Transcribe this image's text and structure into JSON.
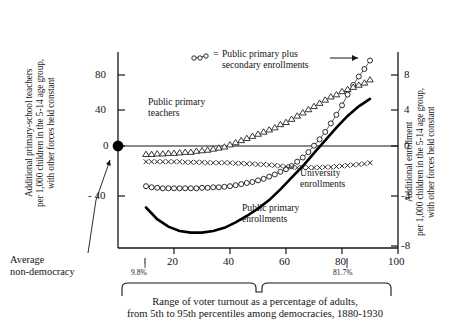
{
  "axis_labels": {
    "left": "Additional primary-school teachers\nper 1,000 children in the 5-14 age group,\nwith other forces held constant",
    "right": "Additional enrollment\nper 1,000 children in the 5-14 age group,\nwith other forces held constant",
    "bottom_caption": "Range of voter turnout as a percentage of adults,\nfrom 5th to 95th percentiles among democracies, 1880-1930"
  },
  "annotations": {
    "average_non_democracy": "Average\nnon-democracy",
    "teachers": "Public primary\nteachers",
    "university": "University\nenrollments",
    "primary_enrollments": "Public primary\nenrollments",
    "legend": "Public primary plus\nsecondary enrollments",
    "legend_equals": "=",
    "pct_low": "9.8%",
    "pct_high": "81.7%"
  },
  "chart_data": {
    "type": "line",
    "title": "",
    "xlabel": "Range of voter turnout as a percentage of adults, from 5th to 95th percentiles among democracies, 1880-1930",
    "ylabel": "Additional primary-school teachers per 1,000 children in the 5-14 age group, with other forces held constant",
    "y2label": "Additional enrollment per 1,000 children in the 5-14 age group, with other forces held constant",
    "xlim": [
      0,
      100
    ],
    "xticks": [
      20,
      40,
      60,
      80,
      100
    ],
    "ylim": [
      -80,
      104
    ],
    "yticks": [
      -40,
      0,
      40,
      80
    ],
    "y2lim": [
      -8,
      10.4
    ],
    "y2ticks": [
      -8,
      -4,
      0,
      4,
      8
    ],
    "grid": false,
    "legend_position": "top-center",
    "reference_points": [
      {
        "name": "average-non-democracy",
        "x": 0,
        "y": 0,
        "marker": "filled-circle"
      }
    ],
    "percentile_markers": [
      {
        "label": "9.8%",
        "x": 9.8
      },
      {
        "label": "81.7%",
        "x": 81.7
      }
    ],
    "series": [
      {
        "name": "Public primary teachers",
        "marker": "open-triangle",
        "axis": "left",
        "x": [
          10,
          12,
          14,
          16,
          18,
          20,
          22,
          24,
          26,
          28,
          30,
          32,
          34,
          36,
          38,
          40,
          42,
          44,
          46,
          48,
          50,
          52,
          54,
          56,
          58,
          60,
          62,
          64,
          66,
          68,
          70,
          72,
          74,
          76,
          78,
          80,
          82,
          84,
          86,
          88,
          90
        ],
        "values": [
          8,
          8,
          8.5,
          8.5,
          9,
          9,
          9.5,
          10,
          10,
          11,
          11.5,
          12,
          13,
          14,
          15,
          17,
          19,
          21,
          23,
          25,
          27,
          29,
          31,
          33,
          36,
          38,
          41,
          44,
          47,
          50,
          53,
          56,
          59,
          62,
          64,
          67,
          69,
          71,
          73,
          75,
          78
        ]
      },
      {
        "name": "University enrollments",
        "marker": "x-cross",
        "axis": "left",
        "x": [
          10,
          12,
          14,
          16,
          18,
          20,
          22,
          24,
          26,
          28,
          30,
          32,
          34,
          36,
          38,
          40,
          42,
          44,
          46,
          48,
          50,
          52,
          54,
          56,
          58,
          60,
          62,
          64,
          66,
          68,
          70,
          72,
          74,
          76,
          78,
          80,
          82,
          84,
          86,
          88,
          90
        ],
        "values": [
          1,
          1,
          1,
          1,
          1,
          1,
          1,
          0.5,
          0.5,
          0.5,
          0.5,
          0,
          0,
          0,
          0,
          0,
          -0.5,
          -0.5,
          -1,
          -1,
          -1.5,
          -1.5,
          -2,
          -2.5,
          -3,
          -3.5,
          -4,
          -4.5,
          -4.5,
          -4.5,
          -4.5,
          -4.5,
          -4,
          -4,
          -3.5,
          -3,
          -2.5,
          -2,
          -1.5,
          -1,
          0
        ]
      },
      {
        "name": "Public primary plus secondary enrollments",
        "marker": "open-circle",
        "axis": "left",
        "x": [
          10,
          12,
          14,
          16,
          18,
          20,
          22,
          24,
          26,
          28,
          30,
          32,
          34,
          36,
          38,
          40,
          42,
          44,
          46,
          48,
          50,
          52,
          54,
          56,
          58,
          60,
          62,
          64,
          66,
          68,
          70,
          72,
          74,
          76,
          78,
          80,
          82,
          84,
          86,
          88,
          90
        ],
        "values": [
          -22,
          -23,
          -23.5,
          -24,
          -24,
          -24,
          -24,
          -24,
          -24,
          -24,
          -23.5,
          -23.5,
          -23,
          -23,
          -22.5,
          -22,
          -21,
          -20,
          -19,
          -18,
          -16.5,
          -15,
          -13,
          -11,
          -8.5,
          -6,
          -3,
          1,
          5,
          10,
          16,
          22,
          29,
          37,
          45,
          54,
          64,
          73,
          81,
          88,
          96
        ]
      },
      {
        "name": "Public primary enrollments",
        "marker": "solid-line",
        "axis": "left",
        "x": [
          10,
          14,
          18,
          22,
          26,
          30,
          34,
          38,
          42,
          46,
          50,
          54,
          58,
          62,
          66,
          70,
          74,
          78,
          82,
          86,
          90
        ],
        "values": [
          -42,
          -53,
          -60,
          -64,
          -65.5,
          -65.5,
          -64,
          -61,
          -56,
          -50,
          -43,
          -35,
          -25,
          -14,
          -3,
          9,
          21,
          33,
          44,
          53,
          60
        ]
      }
    ]
  }
}
